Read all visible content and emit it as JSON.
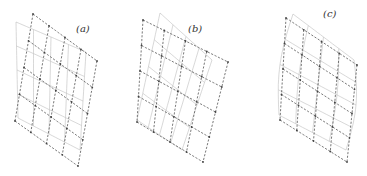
{
  "figure": {
    "panels": [
      {
        "id": "a",
        "label": "(a)",
        "deformation": "shear"
      },
      {
        "id": "b",
        "label": "(b)",
        "deformation": "shear-rotation"
      },
      {
        "id": "c",
        "label": "(c)",
        "deformation": "curved"
      }
    ],
    "grid": {
      "cells_x": 4,
      "cells_y": 4
    },
    "colors": {
      "reference_grid": "#555555",
      "deformed_grid": "#bdbdbd"
    }
  }
}
